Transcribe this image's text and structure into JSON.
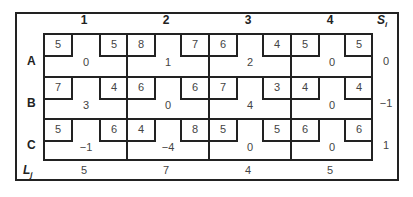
{
  "table": {
    "columns": [
      "1",
      "2",
      "3",
      "4"
    ],
    "rows": [
      "A",
      "B",
      "C"
    ],
    "si_label": "S",
    "si_sub": "i",
    "lj_label": "L",
    "lj_sub": "j",
    "cells": [
      [
        {
          "left": "5",
          "right": "5",
          "value": "0"
        },
        {
          "left": "8",
          "right": "7",
          "value": "1"
        },
        {
          "left": "6",
          "right": "4",
          "value": "2"
        },
        {
          "left": "5",
          "right": "5",
          "value": "0"
        }
      ],
      [
        {
          "left": "7",
          "right": "4",
          "value": "3"
        },
        {
          "left": "6",
          "right": "6",
          "value": "0"
        },
        {
          "left": "7",
          "right": "3",
          "value": "4"
        },
        {
          "left": "4",
          "right": "4",
          "value": "0"
        }
      ],
      [
        {
          "left": "5",
          "right": "6",
          "value": "−1"
        },
        {
          "left": "4",
          "right": "8",
          "value": "−4"
        },
        {
          "left": "5",
          "right": "5",
          "value": "0"
        },
        {
          "left": "6",
          "right": "6",
          "value": "0"
        }
      ]
    ],
    "si": [
      "0",
      "−1",
      "1"
    ],
    "lj": [
      "5",
      "7",
      "4",
      "5"
    ]
  }
}
